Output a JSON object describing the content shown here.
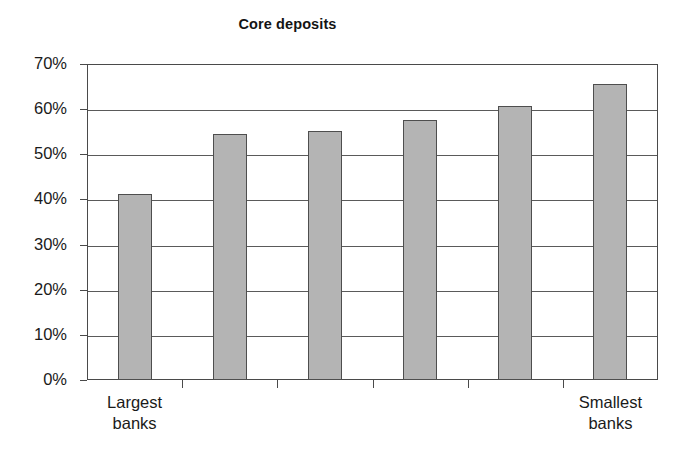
{
  "chart_data": {
    "type": "bar",
    "title": "Core deposits",
    "xlabel": "",
    "ylabel": "",
    "categories": [
      "Largest banks",
      "",
      "",
      "",
      "",
      "Smallest banks"
    ],
    "category_labels": [
      {
        "line1": "Largest",
        "line2": "banks"
      },
      {
        "line1": "Smallest",
        "line2": "banks"
      }
    ],
    "values": [
      41.3,
      54.5,
      55.2,
      57.7,
      60.8,
      65.5
    ],
    "value_labels": [
      "41%",
      "55%",
      "55%",
      "58%",
      "61%",
      "65%"
    ],
    "ylim": [
      0,
      70
    ],
    "ytick_values": [
      70,
      60,
      50,
      40,
      30,
      20,
      10,
      0
    ],
    "ytick_labels": [
      "70%",
      "60%",
      "50%",
      "40%",
      "30%",
      "20%",
      "10%",
      "0%"
    ],
    "grid": true,
    "legend": null,
    "bar_color": "#b4b4b4",
    "bar_border_color": "#4e4e4e",
    "axis_color": "#4a4a4a",
    "text_color": "#1a1a1a"
  }
}
